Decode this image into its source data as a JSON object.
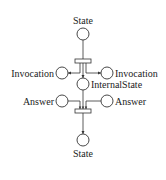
{
  "diagram": {
    "type": "petri-net",
    "places": [
      {
        "id": "state_top",
        "label": "State",
        "cx": 83,
        "cy": 34
      },
      {
        "id": "invocation_left",
        "label": "Invocation",
        "cx": 62,
        "cy": 73
      },
      {
        "id": "invocation_right",
        "label": "Invocation",
        "cx": 107,
        "cy": 73
      },
      {
        "id": "internal_state",
        "label": "InternalState",
        "cx": 83,
        "cy": 84
      },
      {
        "id": "answer_left",
        "label": "Answer",
        "cx": 62,
        "cy": 101
      },
      {
        "id": "answer_right",
        "label": "Answer",
        "cx": 107,
        "cy": 101
      },
      {
        "id": "state_bottom",
        "label": "State",
        "cx": 83,
        "cy": 140
      }
    ],
    "transitions": [
      {
        "id": "t_split",
        "x": 75,
        "y": 59,
        "w": 16,
        "h": 4
      },
      {
        "id": "t_join",
        "x": 75,
        "y": 109,
        "w": 16,
        "h": 4
      }
    ],
    "labels": {
      "state_top": "State",
      "invocation_left": "Invocation",
      "invocation_right": "Invocation",
      "internal_state": "InternalState",
      "answer_left": "Answer",
      "answer_right": "Answer",
      "state_bottom": "State"
    },
    "colors": {
      "stroke": "#333333",
      "text": "#222222",
      "background": "#ffffff"
    }
  }
}
